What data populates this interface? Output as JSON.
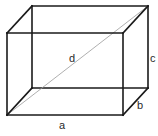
{
  "diagram": {
    "type": "rectangular-prism",
    "vertices": {
      "front_top_left": [
        7,
        33
      ],
      "front_top_right": [
        123,
        33
      ],
      "front_bottom_left": [
        7,
        115
      ],
      "front_bottom_right": [
        123,
        115
      ],
      "back_top_left": [
        32,
        6
      ],
      "back_top_right": [
        148,
        6
      ],
      "back_bottom_left": [
        32,
        88
      ],
      "back_bottom_right": [
        148,
        88
      ]
    },
    "diagonal": {
      "from": "front_bottom_left",
      "to": "back_top_right",
      "color": "#9a9a9a"
    },
    "edge_color": "#1a1a1a",
    "labels": {
      "a": {
        "text": "a",
        "x": 59,
        "y": 129,
        "meaning": "length (front bottom edge)"
      },
      "b": {
        "text": "b",
        "x": 137,
        "y": 109,
        "meaning": "width (depth edge)"
      },
      "c": {
        "text": "c",
        "x": 150,
        "y": 62,
        "meaning": "height (right back edge)"
      },
      "d": {
        "text": "d",
        "x": 69,
        "y": 62,
        "meaning": "space diagonal"
      }
    }
  }
}
